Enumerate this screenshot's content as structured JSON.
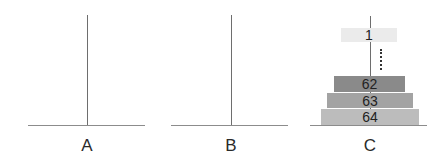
{
  "diagram": {
    "pegs": [
      {
        "id": "A",
        "label": "A",
        "x": 87,
        "base_left": 28,
        "base_right": 145,
        "disks": []
      },
      {
        "id": "B",
        "label": "B",
        "x": 231,
        "base_left": 171,
        "base_right": 288,
        "disks": []
      },
      {
        "id": "C",
        "label": "C",
        "x": 370,
        "base_left": 310,
        "base_right": 427,
        "disks": [
          "1",
          "...",
          "62",
          "63",
          "64"
        ]
      }
    ],
    "disks": [
      {
        "label": "1",
        "color": "#ebebeb",
        "left": 341,
        "top": 28,
        "width": 56,
        "height": 14
      },
      {
        "label": "62",
        "color": "#8a8a8a",
        "left": 334,
        "top": 76,
        "width": 71,
        "height": 16
      },
      {
        "label": "63",
        "color": "#a3a3a3",
        "left": 327,
        "top": 93,
        "width": 86,
        "height": 15
      },
      {
        "label": "64",
        "color": "#bcbcbc",
        "left": 321,
        "top": 109,
        "width": 98,
        "height": 16
      }
    ],
    "ellipsis": {
      "type": "vertical-dotted-line",
      "x": 381,
      "top": 49,
      "height": 21
    },
    "colors": {
      "peg": "#6e6e6e",
      "base": "#8c8c8c",
      "label_text": "#2a2a2a"
    }
  }
}
